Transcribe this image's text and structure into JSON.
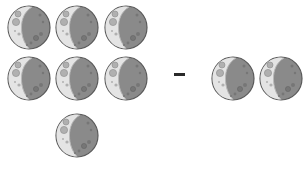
{
  "problem": {
    "type": "subtraction",
    "left_count": 7,
    "right_count": 2,
    "operator": "-",
    "item": "moon"
  },
  "moons_left": [
    {
      "x": 7,
      "y": 5
    },
    {
      "x": 55,
      "y": 5
    },
    {
      "x": 104,
      "y": 5
    },
    {
      "x": 7,
      "y": 56
    },
    {
      "x": 55,
      "y": 56
    },
    {
      "x": 104,
      "y": 56
    },
    {
      "x": 55,
      "y": 113
    }
  ],
  "moons_right": [
    {
      "x": 211,
      "y": 56
    },
    {
      "x": 259,
      "y": 56
    }
  ],
  "colors": {
    "moon_light": "#e4e4e4",
    "moon_dark": "#8a8a8a",
    "moon_outline": "#5a5a5a",
    "crater": "#9c9c9c",
    "operator": "#2a2a2a"
  }
}
